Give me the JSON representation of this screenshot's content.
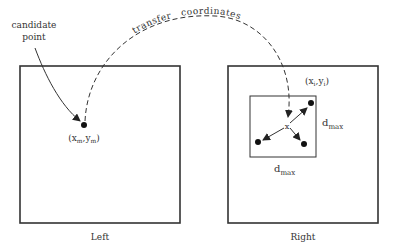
{
  "annotation": {
    "line1": "candidate",
    "line2": "point"
  },
  "arc_label": {
    "part1": "transfer",
    "part2": "coordinates"
  },
  "left_panel": {
    "caption": "Left",
    "point_label": {
      "open": "(x",
      "sub1": "m",
      "mid": ",y",
      "sub2": "m",
      "close": ")"
    }
  },
  "right_panel": {
    "caption": "Right",
    "point_label": {
      "open": "(x",
      "sub1": "i",
      "mid": ",y",
      "sub2": "i",
      "close": ")"
    },
    "dmax_side": {
      "base": "d",
      "sub": "max"
    },
    "dmax_bottom": {
      "base": "d",
      "sub": "max"
    },
    "center_marker": "x"
  },
  "colors": {
    "stroke": "#333333",
    "background": "#ffffff"
  }
}
